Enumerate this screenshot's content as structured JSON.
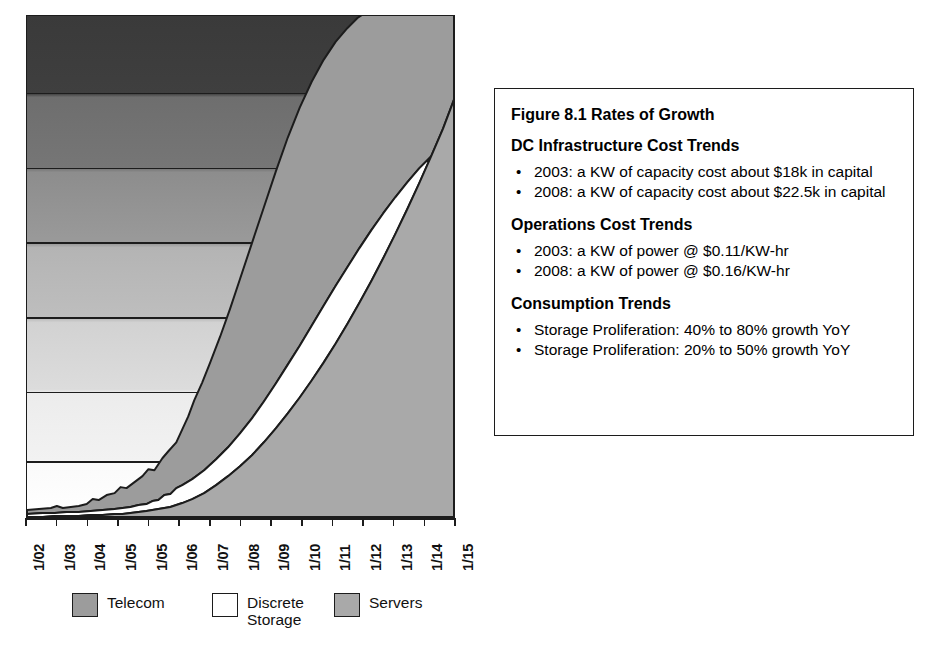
{
  "chart_data": {
    "type": "area",
    "stacked": true,
    "title": "",
    "xlabel": "",
    "ylabel": "",
    "grid": true,
    "gridlines": 6,
    "legend_position": "bottom",
    "categories": [
      "1/02",
      "1/03",
      "1/04",
      "1/05",
      "1/05",
      "1/06",
      "1/07",
      "1/08",
      "1/09",
      "1/10",
      "1/11",
      "1/12",
      "1/13",
      "1/14",
      "1/15"
    ],
    "x_tick_labels": [
      "1/02",
      "1/03",
      "1/04",
      "1/05",
      "1/05",
      "1/06",
      "1/07",
      "1/08",
      "1/09",
      "1/10",
      "1/11",
      "1/12",
      "1/13",
      "1/14",
      "1/15"
    ],
    "note": "Axis tick labels as printed, including the repeated 1/05 in the source figure.",
    "series": [
      {
        "name": "Servers",
        "color": "#a9a9a9",
        "stack_order": 1,
        "values": [
          2,
          3,
          4,
          5,
          7,
          10,
          14,
          20,
          28,
          39,
          53,
          71,
          94,
          122,
          157
        ]
      },
      {
        "name": "Discrete Storage",
        "color": "#ffffff",
        "stack_order": 2,
        "values": [
          1,
          1,
          2,
          3,
          5,
          8,
          12,
          17,
          24,
          33,
          45,
          60,
          79,
          103,
          133
        ]
      },
      {
        "name": "Telecom",
        "color": "#9c9c9c",
        "stack_order": 3,
        "values": [
          3,
          5,
          8,
          12,
          18,
          27,
          39,
          55,
          76,
          104,
          140,
          186,
          244,
          316,
          405
        ]
      }
    ],
    "ylim": [
      0,
      700
    ],
    "xlim": [
      0,
      14
    ]
  },
  "legend": {
    "entries": [
      {
        "label": "Telecom",
        "swatch_color": "#9c9c9c",
        "icon": "legend-swatch-icon"
      },
      {
        "label": "Discrete\nStorage",
        "swatch_color": "#ffffff",
        "icon": "legend-swatch-icon"
      },
      {
        "label": "Servers",
        "swatch_color": "#a9a9a9",
        "icon": "legend-swatch-icon"
      }
    ]
  },
  "info_box": {
    "title": "Figure 8.1 Rates of Growth",
    "sections": [
      {
        "heading": "DC Infrastructure Cost Trends",
        "bullets": [
          "2003: a KW of capacity cost about $18k in capital",
          "2008: a KW of capacity cost about $22.5k in capital"
        ]
      },
      {
        "heading": "Operations Cost Trends",
        "bullets": [
          "2003: a KW of power @ $0.11/KW-hr",
          "2008: a KW of power @ $0.16/KW-hr"
        ]
      },
      {
        "heading": "Consumption Trends",
        "bullets": [
          "Storage Proliferation: 40% to 80% growth YoY",
          "Storage Proliferation: 20% to 50% growth YoY"
        ]
      }
    ],
    "bullet_glyph": "•"
  },
  "colors": {
    "outline": "#1c1c1c",
    "telecom": "#9c9c9c",
    "discrete_storage": "#ffffff",
    "servers": "#a9a9a9",
    "page_background": "#ffffff"
  }
}
